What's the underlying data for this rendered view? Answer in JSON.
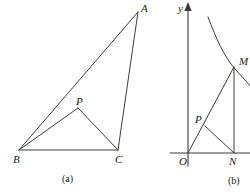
{
  "figure": {
    "width": 250,
    "height": 194,
    "background": "#ffffff",
    "stroke_color": "#3c3c3c",
    "text_color": "#1a1a1a"
  },
  "panel_a": {
    "caption": "(a)",
    "caption_pos": {
      "x": 62,
      "y": 174
    },
    "vertices": {
      "A": {
        "x": 138,
        "y": 12,
        "label": "A",
        "label_x": 141,
        "label_y": 3
      },
      "B": {
        "x": 19,
        "y": 150,
        "label": "B",
        "label_x": 13,
        "label_y": 154
      },
      "C": {
        "x": 118,
        "y": 150,
        "label": "C",
        "label_x": 115,
        "label_y": 154
      },
      "P": {
        "x": 78,
        "y": 108,
        "label": "P",
        "label_x": 76,
        "label_y": 96
      }
    },
    "segments": [
      {
        "name": "side-AB",
        "from": "B",
        "to": "A"
      },
      {
        "name": "side-BC",
        "from": "B",
        "to": "C"
      },
      {
        "name": "side-CA",
        "from": "C",
        "to": "A"
      },
      {
        "name": "cevian-BP",
        "from": "B",
        "to": "P"
      },
      {
        "name": "cevian-PC",
        "from": "P",
        "to": "C"
      }
    ]
  },
  "panel_b": {
    "caption": "(b)",
    "caption_pos": {
      "x": 228,
      "y": 176
    },
    "axes": {
      "origin": {
        "x": 188,
        "y": 153
      },
      "y_axis_label": "y",
      "y_axis_label_x": 178,
      "y_axis_label_y": 3,
      "y_axis_top": 8,
      "x_axis_left": 170,
      "x_axis_right": 250,
      "origin_label": "O",
      "origin_label_x": 179,
      "origin_label_y": 156
    },
    "points": {
      "M": {
        "x": 234,
        "y": 67,
        "label": "M",
        "label_x": 239,
        "label_y": 56
      },
      "N": {
        "x": 234,
        "y": 153,
        "label": "N",
        "label_x": 229,
        "label_y": 156
      },
      "P": {
        "x": 205,
        "y": 126,
        "label": "P",
        "label_x": 195,
        "label_y": 114
      }
    },
    "curve": {
      "name": "hyperbola-branch",
      "path": "M 208 17 C 216 38, 224 57, 236 70 C 243 78, 248 83, 250 86"
    },
    "segments": [
      {
        "name": "ray-O-to-M",
        "from": "O",
        "to": "M"
      },
      {
        "name": "segment-M-to-N",
        "from": "M",
        "to": "N"
      },
      {
        "name": "segment-P-to-N",
        "from": "P",
        "to": "N"
      }
    ]
  }
}
